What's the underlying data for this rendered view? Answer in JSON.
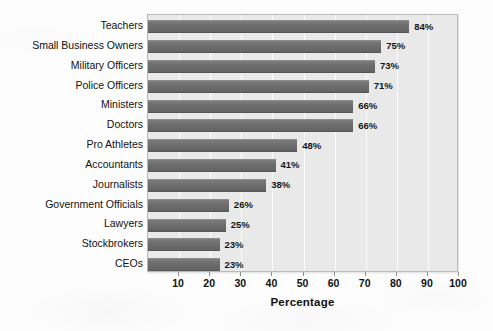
{
  "chart_data": {
    "type": "bar",
    "orientation": "horizontal",
    "title": "",
    "xlabel": "Percentage",
    "ylabel": "",
    "xlim": [
      0,
      100
    ],
    "xticks": [
      10,
      20,
      30,
      40,
      50,
      60,
      70,
      80,
      90,
      100
    ],
    "grid": true,
    "legend": null,
    "value_suffix": "%",
    "categories": [
      "Teachers",
      "Small Business Owners",
      "Military Officers",
      "Police Officers",
      "Ministers",
      "Doctors",
      "Pro Athletes",
      "Accountants",
      "Journalists",
      "Government Officials",
      "Lawyers",
      "Stockbrokers",
      "CEOs"
    ],
    "values": [
      84,
      75,
      73,
      71,
      66,
      66,
      48,
      41,
      38,
      26,
      25,
      23,
      23
    ],
    "value_labels": [
      "84%",
      "75%",
      "73%",
      "71%",
      "66%",
      "66%",
      "48%",
      "41%",
      "38%",
      "26%",
      "25%",
      "23%",
      "23%"
    ]
  },
  "style": {
    "bar_color": "#6d6d6d",
    "plot_background": "#e9e9e9",
    "gridline_color": "#fbfbfb",
    "text_color": "#111111",
    "page_background": "#ffffff"
  }
}
